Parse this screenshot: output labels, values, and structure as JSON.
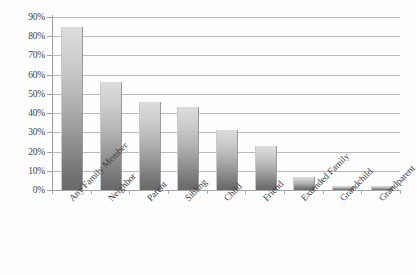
{
  "chart_data": {
    "type": "bar",
    "title": "",
    "subtitle": "",
    "xlabel": "",
    "ylabel": "",
    "ylim": [
      0,
      90
    ],
    "ytick_labels": [
      "0%",
      "10%",
      "20%",
      "30%",
      "40%",
      "50%",
      "60%",
      "70%",
      "80%",
      "90%"
    ],
    "ytick_values": [
      0,
      10,
      20,
      30,
      40,
      50,
      60,
      70,
      80,
      90
    ],
    "grid": true,
    "legend": false,
    "legend_position": "none",
    "categories": [
      "Any Family Member",
      "Neighbor",
      "Parent",
      "Sibling",
      "Child",
      "Friend",
      "Extended Family",
      "Grandchild",
      "Grandparent"
    ],
    "values": [
      85,
      56,
      46,
      43,
      31,
      23,
      7,
      2,
      2
    ],
    "value_labels": [
      "85%",
      "56%",
      "46%",
      "43%",
      "31%",
      "23%",
      "7%",
      "2%",
      "2%"
    ],
    "series": [
      {
        "name": "",
        "values": [
          85,
          56,
          46,
          43,
          31,
          23,
          7,
          2,
          2
        ]
      }
    ],
    "colors": {
      "bar_top": "#dcdcdc",
      "bar_bottom": "#6a6a6a",
      "gridline": "#b9b9b9",
      "axis": "#9d9d9d",
      "text": "#3d3d3d",
      "background": "#fdfdfd"
    }
  }
}
